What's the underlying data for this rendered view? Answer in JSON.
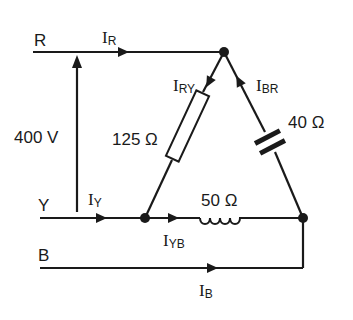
{
  "diagram": {
    "type": "three-phase delta-connected load",
    "lines": {
      "R": {
        "label": "R",
        "current": "I",
        "current_sub": "R"
      },
      "Y": {
        "label": "Y",
        "current": "I",
        "current_sub": "Y"
      },
      "B": {
        "label": "B",
        "current": "I",
        "current_sub": "B"
      }
    },
    "supply_voltage": "400 V",
    "branches": {
      "RY": {
        "current": "I",
        "current_sub": "RY",
        "component": "resistor",
        "value": "125 Ω"
      },
      "BR": {
        "current": "I",
        "current_sub": "BR",
        "component": "capacitor",
        "value": "40 Ω"
      },
      "YB": {
        "current": "I",
        "current_sub": "YB",
        "component": "inductor",
        "value": "50 Ω"
      }
    }
  }
}
